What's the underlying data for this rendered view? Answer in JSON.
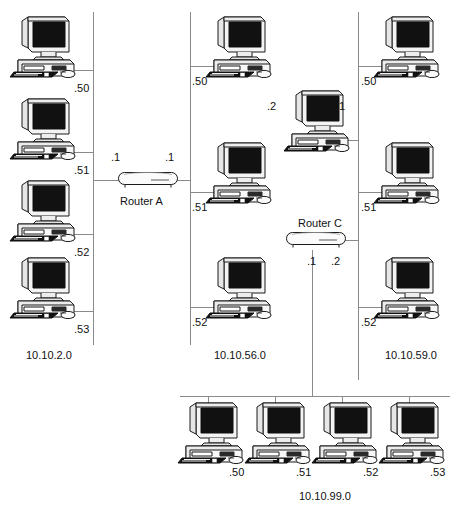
{
  "diagram": {
    "type": "network-topology",
    "width": 471,
    "height": 510,
    "line_color": "#8a8a8a",
    "text_color": "#111111"
  },
  "networks": [
    {
      "id": "net-10-10-2-0",
      "label": "10.10.2.0",
      "orientation": "vertical",
      "label_x": 26,
      "label_y": 350,
      "bus": {
        "x": 93,
        "y1": 12,
        "y2": 345
      },
      "hosts": [
        {
          "name": "pc-10-10-2-50",
          "addr": ".50",
          "pc_x": 8,
          "pc_y": 14,
          "addr_x": 74,
          "addr_y": 83,
          "link_x1": 64,
          "link_x2": 93,
          "link_y": 70,
          "side": "left"
        },
        {
          "name": "pc-10-10-2-51",
          "addr": ".51",
          "pc_x": 8,
          "pc_y": 96,
          "addr_x": 74,
          "addr_y": 165,
          "link_x1": 64,
          "link_x2": 93,
          "link_y": 152,
          "side": "left"
        },
        {
          "name": "pc-10-10-2-52",
          "addr": ".52",
          "pc_x": 8,
          "pc_y": 178,
          "addr_x": 74,
          "addr_y": 247,
          "link_x1": 64,
          "link_x2": 93,
          "link_y": 234,
          "side": "left"
        },
        {
          "name": "pc-10-10-2-53",
          "addr": ".53",
          "pc_x": 8,
          "pc_y": 255,
          "addr_x": 74,
          "addr_y": 324,
          "link_x1": 64,
          "link_x2": 93,
          "link_y": 311,
          "side": "left"
        }
      ]
    },
    {
      "id": "net-10-10-56-0",
      "label": "10.10.56.0",
      "orientation": "vertical",
      "label_x": 214,
      "label_y": 350,
      "bus": {
        "x": 190,
        "y1": 12,
        "y2": 345
      },
      "hosts": [
        {
          "name": "pc-10-10-56-50",
          "addr": ".50",
          "pc_x": 204,
          "pc_y": 14,
          "addr_x": 192,
          "addr_y": 76,
          "link_x1": 190,
          "link_x2": 218,
          "link_y": 66,
          "side": "right"
        },
        {
          "name": "pc-10-10-56-51",
          "addr": ".51",
          "pc_x": 204,
          "pc_y": 140,
          "addr_x": 192,
          "addr_y": 202,
          "link_x1": 190,
          "link_x2": 218,
          "link_y": 192,
          "side": "right"
        },
        {
          "name": "pc-10-10-56-52",
          "addr": ".52",
          "pc_x": 204,
          "pc_y": 255,
          "addr_x": 192,
          "addr_y": 317,
          "link_x1": 190,
          "link_x2": 218,
          "link_y": 307,
          "side": "right"
        }
      ]
    },
    {
      "id": "net-10-10-59-0",
      "label": "10.10.59.0",
      "orientation": "vertical",
      "label_x": 385,
      "label_y": 350,
      "bus": {
        "x": 358,
        "y1": 12,
        "y2": 380
      },
      "hosts": [
        {
          "name": "pc-10-10-59-50",
          "addr": ".50",
          "pc_x": 372,
          "pc_y": 14,
          "addr_x": 361,
          "addr_y": 76,
          "link_x1": 358,
          "link_x2": 386,
          "link_y": 66,
          "side": "right"
        },
        {
          "name": "pc-10-10-59-51",
          "addr": ".51",
          "pc_x": 372,
          "pc_y": 140,
          "addr_x": 361,
          "addr_y": 202,
          "link_x1": 358,
          "link_x2": 386,
          "link_y": 192,
          "side": "right"
        },
        {
          "name": "pc-10-10-59-52",
          "addr": ".52",
          "pc_x": 372,
          "pc_y": 255,
          "addr_x": 361,
          "addr_y": 317,
          "link_x1": 358,
          "link_x2": 386,
          "link_y": 307,
          "side": "right"
        }
      ]
    },
    {
      "id": "net-10-10-99-0",
      "label": "10.10.99.0",
      "orientation": "horizontal",
      "label_x": 299,
      "label_y": 491,
      "bus": {
        "y": 396,
        "x1": 180,
        "x2": 450
      },
      "hosts": [
        {
          "name": "pc-10-10-99-50",
          "addr": ".50",
          "pc_x": 176,
          "pc_y": 400,
          "addr_x": 229,
          "addr_y": 467,
          "link_x": 208,
          "link_y1": 396,
          "link_y2": 404
        },
        {
          "name": "pc-10-10-99-51",
          "addr": ".51",
          "pc_x": 243,
          "pc_y": 400,
          "addr_x": 296,
          "addr_y": 467,
          "link_x": 275,
          "link_y1": 396,
          "link_y2": 404
        },
        {
          "name": "pc-10-10-99-52",
          "addr": ".52",
          "pc_x": 310,
          "pc_y": 400,
          "addr_x": 363,
          "addr_y": 467,
          "link_x": 342,
          "link_y1": 396,
          "link_y2": 404
        },
        {
          "name": "pc-10-10-99-53",
          "addr": ".53",
          "pc_x": 377,
          "pc_y": 400,
          "addr_x": 430,
          "addr_y": 467,
          "link_x": 409,
          "link_y1": 396,
          "link_y2": 404
        }
      ]
    }
  ],
  "routers": [
    {
      "id": "router-a",
      "label": "Router A",
      "icon_x": 117,
      "icon_y": 170,
      "label_x": 120,
      "label_y": 196,
      "interfaces": [
        {
          "addr": ".1",
          "x": 111,
          "y": 152,
          "net": "10.10.2.0"
        },
        {
          "addr": ".1",
          "x": 165,
          "y": 152,
          "net": "10.10.56.0"
        }
      ],
      "links": [
        {
          "x1": 93,
          "x2": 119,
          "y": 180
        },
        {
          "x1": 177,
          "x2": 190,
          "y": 180
        }
      ]
    },
    {
      "id": "router-c",
      "label": "Router C",
      "icon_x": 285,
      "icon_y": 230,
      "label_x": 298,
      "label_y": 218,
      "interfaces": [
        {
          "addr": ".1",
          "x": 307,
          "y": 256,
          "net": "10.10.99.0"
        },
        {
          "addr": ".2",
          "x": 331,
          "y": 256,
          "net": "10.10.59.0"
        }
      ],
      "links": [
        {
          "x1": 345,
          "x2": 358,
          "y": 240
        }
      ],
      "vlinks": [
        {
          "x": 312,
          "y1": 250,
          "y2": 396
        }
      ]
    }
  ],
  "multihomed_hosts": [
    {
      "id": "host-dual-homed",
      "name": "pc-dual-homed",
      "pc_x": 282,
      "pc_y": 88,
      "interfaces": [
        {
          "addr": ".2",
          "x": 267,
          "y": 101,
          "net": "10.10.56.0"
        },
        {
          "addr": ".1",
          "x": 336,
          "y": 101,
          "net": "10.10.59.0"
        }
      ],
      "links": [
        {
          "x1": 340,
          "x2": 358,
          "y": 140
        }
      ]
    }
  ]
}
